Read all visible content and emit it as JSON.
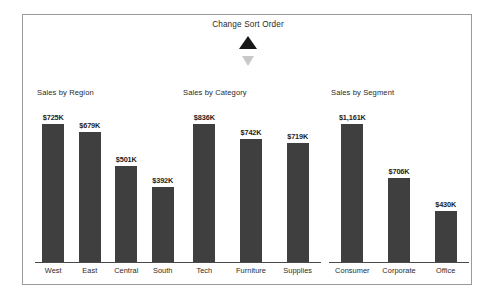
{
  "sort_control": {
    "title": "Change Sort Order",
    "ascending_icon": "triangle-up-icon",
    "descending_icon": "triangle-down-icon",
    "active": "ascending",
    "active_color": "#181818",
    "inactive_color": "#c9c9c9"
  },
  "theme": {
    "bar_color": "#3f3f3f",
    "axis_color": "#4a4a4a",
    "border_color": "#9a9a9a",
    "text_color": "#2a2a2a",
    "background": "#ffffff"
  },
  "chart_data": [
    {
      "type": "bar",
      "title": "Sales by Region",
      "xlabel": "",
      "ylabel": "",
      "grid": false,
      "legend": "none",
      "categories": [
        "West",
        "East",
        "Central",
        "South"
      ],
      "values": [
        725,
        679,
        501,
        392
      ],
      "value_labels": [
        "$725K",
        "$679K",
        "$501K",
        "$392K"
      ],
      "units": "thousands USD",
      "ylim": [
        0,
        725
      ]
    },
    {
      "type": "bar",
      "title": "Sales by Category",
      "xlabel": "",
      "ylabel": "",
      "grid": false,
      "legend": "none",
      "categories": [
        "Tech",
        "Furniture",
        "Supplies"
      ],
      "values": [
        836,
        742,
        719
      ],
      "value_labels": [
        "$836K",
        "$742K",
        "$719K"
      ],
      "units": "thousands USD",
      "ylim": [
        0,
        836
      ]
    },
    {
      "type": "bar",
      "title": "Sales by Segment",
      "xlabel": "",
      "ylabel": "",
      "grid": false,
      "legend": "none",
      "categories": [
        "Consumer",
        "Corporate",
        "Office"
      ],
      "values": [
        1161,
        706,
        430
      ],
      "value_labels": [
        "$1,161K",
        "$706K",
        "$430K"
      ],
      "units": "thousands USD",
      "ylim": [
        0,
        1161
      ]
    }
  ]
}
